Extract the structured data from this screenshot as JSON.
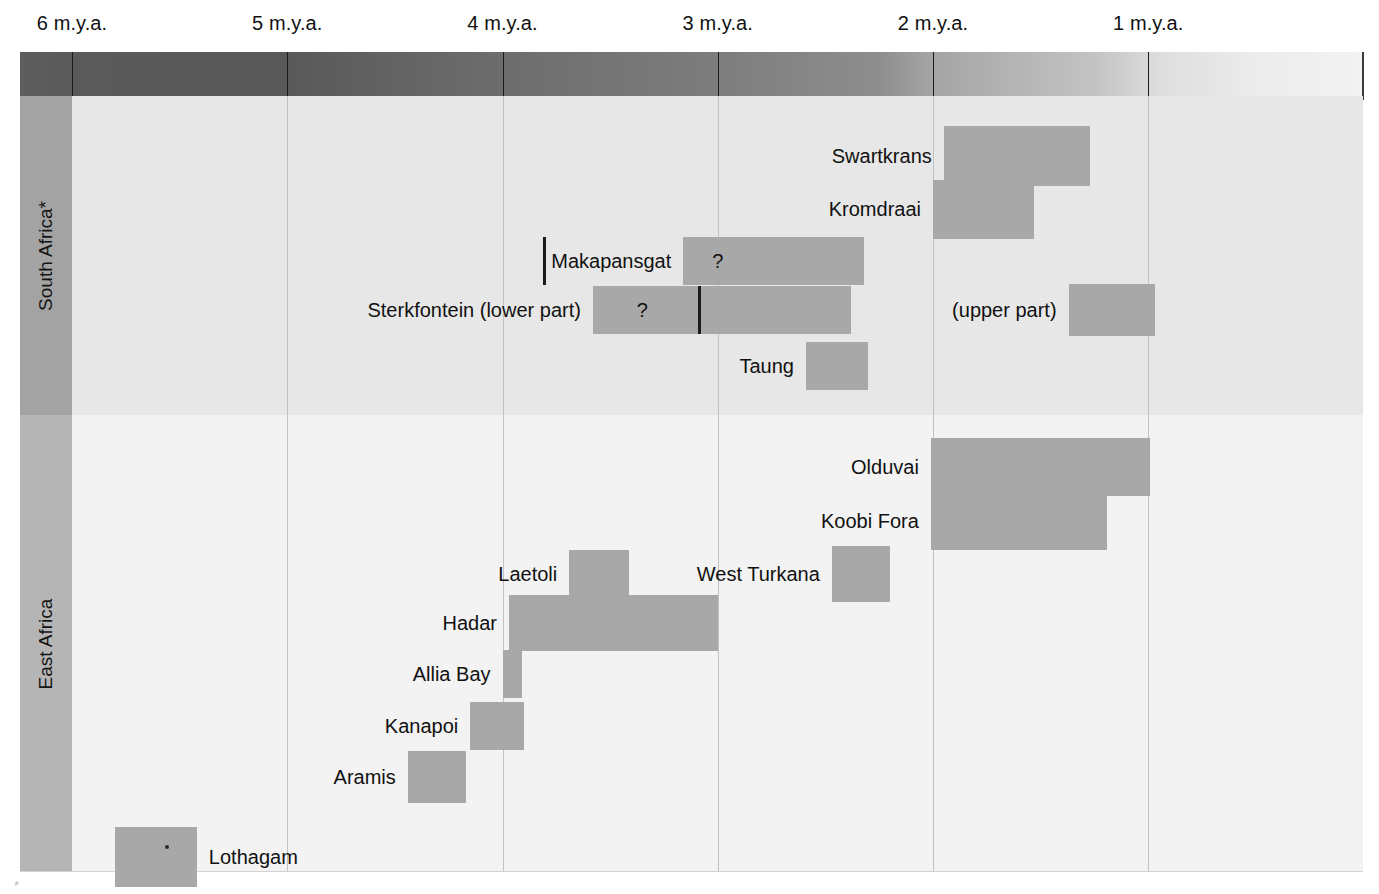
{
  "chart_data": {
    "type": "bar",
    "title": "",
    "xlabel": "",
    "ylabel": "",
    "orientation": "horizontal-ranges",
    "axis": {
      "unit": "m.y.a.",
      "ticks": [
        {
          "label": "6 m.y.a.",
          "value": 6
        },
        {
          "label": "5 m.y.a.",
          "value": 5
        },
        {
          "label": "4 m.y.a.",
          "value": 4
        },
        {
          "label": "3 m.y.a.",
          "value": 3
        },
        {
          "label": "2 m.y.a.",
          "value": 2
        },
        {
          "label": "1 m.y.a.",
          "value": 1
        }
      ],
      "range_left_mya": 6.24,
      "range_right_mya": 0.0,
      "grid": true,
      "direction": "older-to-younger"
    },
    "groups": [
      {
        "name": "South Africa*",
        "label": "South Africa*",
        "sites": [
          {
            "name": "Swartkrans",
            "label": "Swartkrans",
            "label_side": "right",
            "start_mya": 1.95,
            "end_mya": 1.27,
            "segments": [],
            "marks": []
          },
          {
            "name": "Kromdraai",
            "label": "Kromdraai",
            "label_side": "right",
            "start_mya": 2.0,
            "end_mya": 1.53,
            "segments": [],
            "marks": []
          },
          {
            "name": "Makapansgat",
            "label": "Makapansgat",
            "label_side": "right",
            "start_mya": 3.16,
            "end_mya": 2.32,
            "segments": [
              3.81
            ],
            "marks": [
              {
                "text": "?",
                "at_mya": 3.0
              }
            ]
          },
          {
            "name": "Sterkfontein (lower part)",
            "label": "Sterkfontein (lower part)",
            "label_side": "right",
            "start_mya": 3.58,
            "end_mya": 2.38,
            "segments": [
              3.09
            ],
            "marks": [
              {
                "text": "?",
                "at_mya": 3.35
              }
            ]
          },
          {
            "name": "Sterkfontein (upper part)",
            "label": "(upper part)",
            "label_side": "right",
            "start_mya": 1.37,
            "end_mya": 0.97,
            "segments": [],
            "marks": []
          },
          {
            "name": "Taung",
            "label": "Taung",
            "label_side": "right",
            "start_mya": 2.59,
            "end_mya": 2.3,
            "segments": [],
            "marks": []
          }
        ]
      },
      {
        "name": "East Africa",
        "label": "East Africa",
        "sites": [
          {
            "name": "Olduvai",
            "label": "Olduvai",
            "label_side": "right",
            "start_mya": 2.01,
            "end_mya": 0.99,
            "segments": [],
            "marks": []
          },
          {
            "name": "Koobi Fora",
            "label": "Koobi Fora",
            "label_side": "right",
            "start_mya": 2.01,
            "end_mya": 1.19,
            "segments": [],
            "marks": []
          },
          {
            "name": "West Turkana",
            "label": "West Turkana",
            "label_side": "right",
            "start_mya": 2.47,
            "end_mya": 2.2,
            "segments": [],
            "marks": []
          },
          {
            "name": "Laetoli",
            "label": "Laetoli",
            "label_side": "right",
            "start_mya": 3.69,
            "end_mya": 3.41,
            "segments": [],
            "marks": []
          },
          {
            "name": "Hadar",
            "label": "Hadar",
            "label_side": "right",
            "start_mya": 3.97,
            "end_mya": 3.0,
            "segments": [],
            "marks": []
          },
          {
            "name": "Allia Bay",
            "label": "Allia Bay",
            "label_side": "right",
            "start_mya": 4.0,
            "end_mya": 3.91,
            "segments": [],
            "marks": []
          },
          {
            "name": "Kanapoi",
            "label": "Kanapoi",
            "label_side": "right",
            "start_mya": 4.15,
            "end_mya": 3.9,
            "segments": [],
            "marks": []
          },
          {
            "name": "Aramis",
            "label": "Aramis",
            "label_side": "right",
            "start_mya": 4.44,
            "end_mya": 4.17,
            "segments": [],
            "marks": []
          },
          {
            "name": "Lothagam",
            "label": "Lothagam",
            "label_side": "left",
            "start_mya": 5.8,
            "end_mya": 5.42,
            "segments": [],
            "marks": [],
            "point_marker": 5.57
          }
        ]
      }
    ],
    "colors": {
      "bar_fill": "#a8a8a8",
      "band_south": "#e7e7e7",
      "band_east": "#f3f3f3",
      "strip_south": "#a3a3a3",
      "strip_east": "#b5b5b5",
      "gridline": "#c2c2c2",
      "divider": "#1c1c1c",
      "text": "#111111"
    }
  },
  "footnote": {
    "mark": "*"
  }
}
